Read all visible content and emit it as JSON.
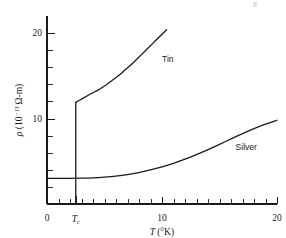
{
  "figure": {
    "kind": "line-plot",
    "background_color": "#ffffff",
    "ink_color": "#1a1a1a"
  },
  "chart_data": {
    "type": "line",
    "title": "",
    "subtitle": "",
    "xlabel": "T (°K)",
    "xlabel_parts": {
      "symbol": "T",
      "unit": "(°K)"
    },
    "ylabel": "ρ (10⁻¹¹ Ω-m)",
    "ylabel_parts": {
      "symbol": "ρ",
      "prefix": "(10",
      "exponent": "−11",
      "suffix": "Ω-m)"
    },
    "xlim": [
      0,
      20
    ],
    "ylim": [
      0,
      22
    ],
    "grid": false,
    "legend": "inline-labels",
    "x_ticks_major": [
      0,
      10,
      20
    ],
    "x_tick_labels": [
      "0",
      "10",
      "20"
    ],
    "x_ticks_minor": [
      1,
      2,
      3,
      4,
      5,
      6,
      7,
      8,
      9,
      11,
      12,
      13,
      14,
      15,
      16,
      17,
      18,
      19
    ],
    "y_ticks_major": [
      10,
      20
    ],
    "y_tick_labels": [
      "10",
      "20"
    ],
    "y_ticks_minor": [
      2,
      4,
      6,
      8,
      12,
      14,
      16,
      18
    ],
    "annotations": [
      {
        "text": "T_c",
        "display": "Tc",
        "symbol": "T",
        "subscript": "c",
        "x": 2.5,
        "y": 0,
        "role": "critical-temperature-tick-label"
      }
    ],
    "series": [
      {
        "name": "Tin",
        "label": "Tin",
        "label_x": 10.0,
        "label_y": 16.6,
        "color": "#1a1a1a",
        "transition_temperature": 2.5,
        "segments": [
          {
            "role": "superconducting-zero-resistivity",
            "points": [
              [
                2.5,
                0.0
              ],
              [
                2.5,
                0.0
              ]
            ]
          },
          {
            "role": "normal-state-jump",
            "points": [
              [
                2.5,
                0.0
              ],
              [
                2.5,
                11.9
              ]
            ]
          },
          {
            "role": "normal-state-curve",
            "points": [
              [
                2.5,
                11.9
              ],
              [
                2.9,
                12.2
              ],
              [
                3.3,
                12.5
              ],
              [
                3.8,
                12.9
              ],
              [
                4.4,
                13.3
              ],
              [
                5.0,
                13.8
              ],
              [
                5.6,
                14.4
              ],
              [
                6.2,
                15.0
              ],
              [
                6.8,
                15.7
              ],
              [
                7.4,
                16.4
              ],
              [
                8.0,
                17.2
              ],
              [
                8.6,
                18.0
              ],
              [
                9.2,
                18.8
              ],
              [
                9.8,
                19.6
              ],
              [
                10.4,
                20.4
              ]
            ]
          }
        ]
      },
      {
        "name": "Silver",
        "label": "Silver",
        "label_x": 16.4,
        "label_y": 6.3,
        "color": "#1a1a1a",
        "segments": [
          {
            "role": "residual-plus-phonon-resistivity",
            "points": [
              [
                0.0,
                3.0
              ],
              [
                1.0,
                3.0
              ],
              [
                2.0,
                3.0
              ],
              [
                3.0,
                3.02
              ],
              [
                4.0,
                3.06
              ],
              [
                5.0,
                3.14
              ],
              [
                6.0,
                3.26
              ],
              [
                7.0,
                3.44
              ],
              [
                8.0,
                3.68
              ],
              [
                9.0,
                3.98
              ],
              [
                10.0,
                4.34
              ],
              [
                11.0,
                4.76
              ],
              [
                12.0,
                5.24
              ],
              [
                13.0,
                5.78
              ],
              [
                14.0,
                6.36
              ],
              [
                15.0,
                6.98
              ],
              [
                16.0,
                7.62
              ],
              [
                17.0,
                8.24
              ],
              [
                18.0,
                8.82
              ],
              [
                19.0,
                9.34
              ],
              [
                20.0,
                9.8
              ]
            ]
          }
        ]
      }
    ]
  }
}
